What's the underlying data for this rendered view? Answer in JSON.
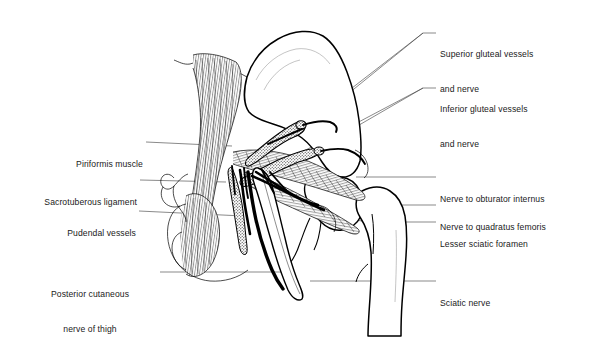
{
  "figure": {
    "view": "posterior view of right gluteal region, gluteus maximus and medius removed"
  },
  "labels": {
    "superior_gluteal": {
      "id": "superior-gluteal-vessels-and-nerve",
      "line1": "Superior gluteal vessels",
      "line2": "and nerve",
      "side": "right"
    },
    "inferior_gluteal": {
      "id": "inferior-gluteal-vessels-and-nerve",
      "line1": "Inferior gluteal vessels",
      "line2": "and nerve",
      "side": "right"
    },
    "obturator_internus": {
      "id": "nerve-to-obturator-internus",
      "line1": "Nerve to obturator internus",
      "side": "right"
    },
    "quadratus_femoris": {
      "id": "nerve-to-quadratus-femoris",
      "line1": "Nerve to quadratus femoris",
      "side": "right"
    },
    "lesser_sciatic_foramen": {
      "id": "lesser-sciatic-foramen",
      "line1": "Lesser sciatic foramen",
      "side": "right"
    },
    "sciatic_nerve": {
      "id": "sciatic-nerve",
      "line1": "Sciatic nerve",
      "side": "right"
    },
    "piriformis": {
      "id": "piriformis-muscle",
      "line1": "Piriformis muscle",
      "side": "left"
    },
    "sacrotuberous": {
      "id": "sacrotuberous-ligament",
      "line1": "Sacrotuberous ligament",
      "side": "left"
    },
    "pudendal": {
      "id": "pudendal-vessels",
      "line1": "Pudendal vessels",
      "side": "left"
    },
    "posterior_cutaneous": {
      "id": "posterior-cutaneous-nerve-of-thigh",
      "line1": "Posterior cutaneous",
      "line2": "nerve of thigh",
      "side": "left"
    }
  },
  "colors": {
    "ink": "#000000",
    "paper": "#ffffff",
    "leader": "#3a3a3a",
    "text": "#1a1a1a"
  }
}
